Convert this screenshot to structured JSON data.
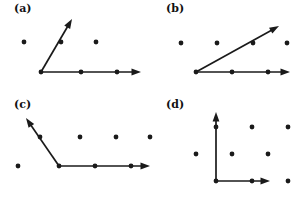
{
  "figure": {
    "title": "",
    "width": 304,
    "height": 197,
    "background": "#ffffff",
    "ink_color": "#1a1a1a",
    "dot_radius": 2.4,
    "panel_count": 4
  },
  "panels": [
    {
      "id": "a",
      "label": "(a)",
      "label_pos": [
        14,
        2
      ],
      "origin": [
        41,
        72
      ],
      "lattice_dots": [
        [
          24,
          42
        ],
        [
          61,
          42
        ],
        [
          96,
          42
        ],
        [
          41,
          72
        ],
        [
          81,
          72
        ],
        [
          117,
          72
        ]
      ],
      "vectors": [
        {
          "name": "horizontal-vector",
          "from": [
            41,
            72
          ],
          "to": [
            141,
            72
          ],
          "passes_through": [
            [
              81,
              72
            ],
            [
              117,
              72
            ]
          ]
        },
        {
          "name": "diagonal-vector",
          "from": [
            41,
            72
          ],
          "to": [
            72,
            19
          ],
          "passes_through": [
            [
              61,
              42
            ]
          ]
        }
      ]
    },
    {
      "id": "b",
      "label": "(b)",
      "label_pos": [
        14,
        2
      ],
      "origin": [
        44,
        72
      ],
      "lattice_dots": [
        [
          29,
          43
        ],
        [
          65,
          43
        ],
        [
          101,
          43
        ],
        [
          135,
          43
        ],
        [
          44,
          72
        ],
        [
          80,
          72
        ],
        [
          116,
          72
        ]
      ],
      "vectors": [
        {
          "name": "horizontal-vector",
          "from": [
            44,
            72
          ],
          "to": [
            138,
            72
          ],
          "passes_through": [
            [
              80,
              72
            ],
            [
              116,
              72
            ]
          ]
        },
        {
          "name": "diagonal-vector",
          "from": [
            44,
            72
          ],
          "to": [
            127,
            26
          ],
          "passes_through": [
            [
              101,
              43
            ]
          ]
        }
      ]
    },
    {
      "id": "c",
      "label": "(c)",
      "label_pos": [
        14,
        2
      ],
      "origin": [
        59,
        70
      ],
      "lattice_dots": [
        [
          40,
          41
        ],
        [
          80,
          41
        ],
        [
          116,
          41
        ],
        [
          150,
          41
        ],
        [
          18,
          70
        ],
        [
          59,
          70
        ],
        [
          95,
          70
        ],
        [
          131,
          70
        ]
      ],
      "vectors": [
        {
          "name": "horizontal-vector",
          "from": [
            59,
            70
          ],
          "to": [
            150,
            70
          ],
          "passes_through": [
            [
              95,
              70
            ],
            [
              131,
              70
            ]
          ]
        },
        {
          "name": "up-left-vector",
          "from": [
            59,
            70
          ],
          "to": [
            26,
            22
          ],
          "passes_through": [
            [
              40,
              41
            ]
          ]
        }
      ]
    },
    {
      "id": "d",
      "label": "(d)",
      "label_pos": [
        14,
        2
      ],
      "origin": [
        64,
        85
      ],
      "lattice_dots": [
        [
          64,
          31
        ],
        [
          100,
          31
        ],
        [
          136,
          31
        ],
        [
          44,
          58
        ],
        [
          80,
          58
        ],
        [
          116,
          58
        ],
        [
          64,
          85
        ],
        [
          100,
          85
        ],
        [
          136,
          85
        ]
      ],
      "vectors": [
        {
          "name": "vertical-vector",
          "from": [
            64,
            85
          ],
          "to": [
            64,
            16
          ],
          "passes_through": [
            [
              64,
              31
            ]
          ]
        },
        {
          "name": "horizontal-vector",
          "from": [
            64,
            85
          ],
          "to": [
            118,
            85
          ],
          "passes_through": [
            [
              100,
              85
            ]
          ]
        }
      ]
    }
  ]
}
